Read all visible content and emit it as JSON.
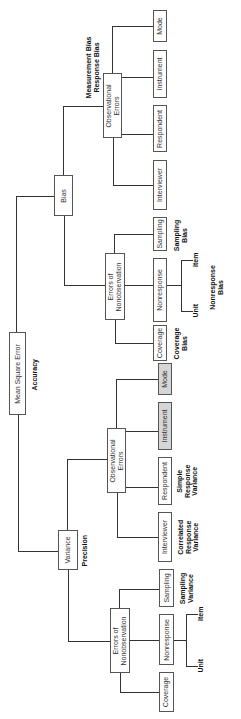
{
  "root": {
    "label": "Mean Square Error",
    "annotation": "Accuracy"
  },
  "bias": {
    "label": "Bias",
    "observational": {
      "label": "Observational Errors",
      "annotation": "Measurement Bias\nResponse Bias",
      "leaves": [
        "Mode",
        "Instrument",
        "Respondent",
        "Interviewer"
      ]
    },
    "nonobservation": {
      "label": "Errors of Nonobservation",
      "leaves": [
        "Sampling",
        "Nonresponse",
        "Coverage"
      ],
      "sampling_annotation": "Sampling Bias",
      "nonresponse_annotation": "Nonresponse Bias",
      "nonresponse_types": [
        "Item",
        "Unit"
      ],
      "coverage_annotation": "Coverage Bias"
    }
  },
  "variance": {
    "label": "Variance",
    "annotation": "Precision",
    "observational": {
      "label": "Observational Errors",
      "leaves": [
        "Mode",
        "Instrument",
        "Respondent",
        "Interviewer"
      ],
      "shaded_leaves": [
        "Mode",
        "Instrument"
      ],
      "respondent_annotation": "Simple Response Variance",
      "interviewer_annotation": "Correlated Response Variance"
    },
    "nonobservation": {
      "label": "Errors of Nonobservation",
      "leaves": [
        "Sampling",
        "Nonresponse",
        "Coverage"
      ],
      "sampling_annotation": "Sampling Variance",
      "nonresponse_types": [
        "Item",
        "Unit"
      ]
    }
  },
  "colors": {
    "line": "#333333",
    "box_border": "#555555",
    "shaded_fill": "#d6d6d6"
  }
}
